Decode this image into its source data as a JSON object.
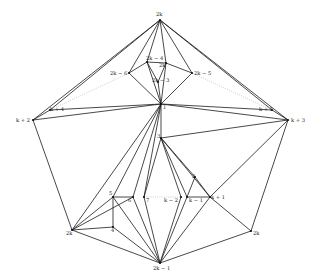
{
  "diagram": {
    "type": "graph-drawing",
    "vertices": [
      {
        "id": "v2k_top",
        "label": "2k",
        "x": 160,
        "y": 20,
        "lx": 156,
        "ly": 16
      },
      {
        "id": "v2k_4",
        "label": "2k − 4",
        "x": 147,
        "y": 62,
        "lx": 146,
        "ly": 60
      },
      {
        "id": "v2k_p",
        "label": "2k′",
        "x": 166,
        "y": 63,
        "lx": 159,
        "ly": 67
      },
      {
        "id": "v2k_6",
        "label": "2k − 6",
        "x": 129,
        "y": 73,
        "lx": 110,
        "ly": 75
      },
      {
        "id": "v2k_5",
        "label": "2k − 5",
        "x": 192,
        "y": 73,
        "lx": 194,
        "ly": 75
      },
      {
        "id": "v2k_3",
        "label": "2k − 3",
        "x": 158,
        "y": 82,
        "lx": 152,
        "ly": 82
      },
      {
        "id": "v1",
        "label": "1",
        "x": 161,
        "y": 104,
        "lx": 163,
        "ly": 109
      },
      {
        "id": "vk2",
        "label": "k + 2",
        "x": 33,
        "y": 120,
        "lx": 16,
        "ly": 122
      },
      {
        "id": "vk3",
        "label": "k + 3",
        "x": 288,
        "y": 120,
        "lx": 291,
        "ly": 122
      },
      {
        "id": "vk4",
        "label": "k + 4",
        "x": 50,
        "y": 110,
        "lx": 50,
        "ly": 111
      },
      {
        "id": "vk5",
        "label": "k + 5",
        "x": 272,
        "y": 110,
        "lx": 259,
        "ly": 111
      },
      {
        "id": "v3",
        "label": "3",
        "x": 161,
        "y": 138,
        "lx": 157,
        "ly": 138
      },
      {
        "id": "v2",
        "label": "2",
        "x": 195,
        "y": 177,
        "lx": 192,
        "ly": 178
      },
      {
        "id": "v5",
        "label": "5",
        "x": 113,
        "y": 197,
        "lx": 109,
        "ly": 195
      },
      {
        "id": "v6",
        "label": "6",
        "x": 133,
        "y": 197,
        "lx": 128,
        "ly": 202
      },
      {
        "id": "v7",
        "label": "7",
        "x": 144,
        "y": 197,
        "lx": 146,
        "ly": 202
      },
      {
        "id": "vkm2",
        "label": "k − 2",
        "x": 181,
        "y": 197,
        "lx": 164,
        "ly": 202
      },
      {
        "id": "vkm1",
        "label": "k − 1",
        "x": 187,
        "y": 197,
        "lx": 189,
        "ly": 202
      },
      {
        "id": "vkp1",
        "label": "k + 1",
        "x": 210,
        "y": 197,
        "lx": 211,
        "ly": 199
      },
      {
        "id": "v2k_left",
        "label": "2k",
        "x": 72,
        "y": 230,
        "lx": 66,
        "ly": 235
      },
      {
        "id": "v4",
        "label": "4",
        "x": 113,
        "y": 227,
        "lx": 111,
        "ly": 232
      },
      {
        "id": "v2k_right",
        "label": "2k",
        "x": 251,
        "y": 231,
        "lx": 253,
        "ly": 235
      },
      {
        "id": "v2k_1",
        "label": "2k − 1",
        "x": 160,
        "y": 263,
        "lx": 153,
        "ly": 270
      }
    ],
    "edges": [
      [
        "v2k_top",
        "vk2"
      ],
      [
        "v2k_top",
        "vk3"
      ],
      [
        "v2k_top",
        "v2k_4"
      ],
      [
        "v2k_top",
        "v2k_p"
      ],
      [
        "v2k_top",
        "v2k_6"
      ],
      [
        "v2k_top",
        "v2k_5"
      ],
      [
        "v2k_top",
        "vk4"
      ],
      [
        "v2k_top",
        "vk5"
      ],
      [
        "v2k_4",
        "v2k_p"
      ],
      [
        "v2k_4",
        "v2k_6"
      ],
      [
        "v2k_p",
        "v2k_5"
      ],
      [
        "v2k_4",
        "v2k_3"
      ],
      [
        "v2k_p",
        "v2k_3"
      ],
      [
        "v2k_6",
        "v1"
      ],
      [
        "v2k_5",
        "v1"
      ],
      [
        "v2k_3",
        "v1"
      ],
      [
        "v2k_4",
        "v1"
      ],
      [
        "v2k_p",
        "v1"
      ],
      [
        "vk2",
        "v1"
      ],
      [
        "vk3",
        "v1"
      ],
      [
        "vk4",
        "v1"
      ],
      [
        "vk5",
        "v1"
      ],
      [
        "vk2",
        "vk4"
      ],
      [
        "vk3",
        "vk5"
      ],
      [
        "vk2",
        "v2k_left"
      ],
      [
        "vk3",
        "v2k_right"
      ],
      [
        "v1",
        "v3"
      ],
      [
        "v1",
        "v2k_left"
      ],
      [
        "v1",
        "v5"
      ],
      [
        "v1",
        "v6"
      ],
      [
        "v1",
        "v7"
      ],
      [
        "v3",
        "vk3"
      ],
      [
        "v3",
        "v7"
      ],
      [
        "v3",
        "vkm2"
      ],
      [
        "v3",
        "vkm1"
      ],
      [
        "v3",
        "vkp1"
      ],
      [
        "v3",
        "v2"
      ],
      [
        "v2",
        "vkm1"
      ],
      [
        "v2",
        "vkp1"
      ],
      [
        "v5",
        "v6"
      ],
      [
        "v5",
        "v2k_left"
      ],
      [
        "v5",
        "v4"
      ],
      [
        "v5",
        "v2k_1"
      ],
      [
        "v6",
        "v2k_1"
      ],
      [
        "v7",
        "v2k_1"
      ],
      [
        "vkm2",
        "v2k_1"
      ],
      [
        "vkm1",
        "v2k_1"
      ],
      [
        "vkp1",
        "v2k_1"
      ],
      [
        "vkp1",
        "vk3"
      ],
      [
        "vkp1",
        "v2k_right"
      ],
      [
        "vkm1",
        "vkp1"
      ],
      [
        "v2k_left",
        "v4"
      ],
      [
        "v4",
        "v2k_1"
      ],
      [
        "v2k_left",
        "v2k_1"
      ],
      [
        "v2k_right",
        "v2k_1"
      ],
      [
        "v2k_left",
        "v6"
      ]
    ],
    "dotted_edges": [
      [
        "vk4",
        "v2k_6"
      ],
      [
        "vk5",
        "v2k_5"
      ],
      [
        "v7",
        "vkm2"
      ]
    ]
  }
}
